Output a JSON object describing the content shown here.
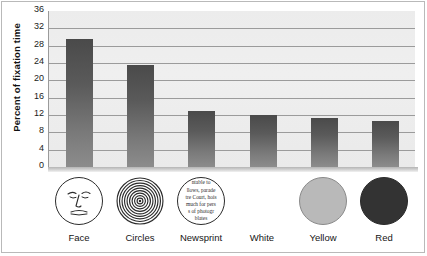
{
  "chart_data": {
    "type": "bar",
    "title": "",
    "xlabel": "",
    "ylabel": "Percent of fixation time",
    "categories": [
      "Face",
      "Circles",
      "Newsprint",
      "White",
      "Yellow",
      "Red"
    ],
    "values": [
      29.5,
      23.5,
      13.0,
      12.0,
      11.3,
      10.5
    ],
    "yticks": [
      0,
      4,
      8,
      12,
      16,
      20,
      24,
      28,
      32,
      36
    ],
    "ylim": [
      0,
      36
    ],
    "grid": true,
    "legend": false,
    "bar_color": "#5a5a5a",
    "panel_color": "#ececec",
    "gridline_color": "#9b9b9b",
    "stimulus_swatches": [
      {
        "label": "Face",
        "icon": "schematic-face-icon",
        "kind": "face"
      },
      {
        "label": "Circles",
        "icon": "concentric-circles-icon",
        "kind": "concentric"
      },
      {
        "label": "Newsprint",
        "icon": "newsprint-icon",
        "kind": "newsprint"
      },
      {
        "label": "White",
        "icon": "white-disc-icon",
        "kind": "white",
        "fill": "#ffffff"
      },
      {
        "label": "Yellow",
        "icon": "yellow-disc-icon",
        "kind": "yellow",
        "fill": "#b9b9b9"
      },
      {
        "label": "Red",
        "icon": "red-disc-icon",
        "kind": "red",
        "fill": "#333333"
      }
    ],
    "newsprint_lines": [
      "ntable to",
      "llows, parade",
      "tre Court, hois",
      "much for pers",
      "s of photogr",
      "blates"
    ]
  }
}
